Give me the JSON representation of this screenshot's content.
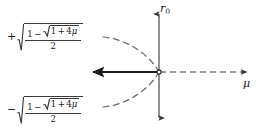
{
  "figure": {
    "background_color": "#ffffff",
    "ink_color": "#1a1a1a",
    "axis_color": "#3a3a3a"
  },
  "axes": {
    "vertical": {
      "label": "r",
      "label_subscript": "0",
      "name": "r0-axis",
      "arrow_top": true,
      "arrow_bottom": true,
      "style": "solid"
    },
    "horizontal": {
      "label": "μ",
      "name": "mu-axis",
      "arrow_left": true,
      "arrow_right": true,
      "left_segment_style": "solid-bold",
      "right_segment_style": "dashed"
    },
    "origin_marker": "open-circle"
  },
  "branches": {
    "upper": {
      "sign": "+",
      "outer_radical": true,
      "numerator_leading": "1",
      "numerator_operator": "−",
      "inner_radical_content": "1 + 4μ",
      "inner_one": "1",
      "inner_operator": "+",
      "inner_coefficient": "4",
      "inner_variable": "μ",
      "denominator": "2",
      "expression": "+√((1 − √(1 + 4μ)) / 2)",
      "curve_style": "dashed"
    },
    "lower": {
      "sign": "−",
      "outer_radical": true,
      "numerator_leading": "1",
      "numerator_operator": "−",
      "inner_radical_content": "1 + 4μ",
      "inner_one": "1",
      "inner_operator": "+",
      "inner_coefficient": "4",
      "inner_variable": "μ",
      "denominator": "2",
      "expression": "−√((1 − √(1 + 4μ)) / 2)",
      "curve_style": "dashed"
    }
  }
}
